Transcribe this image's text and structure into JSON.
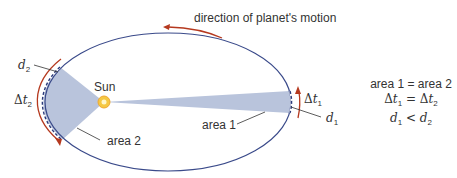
{
  "title": "direction of planet's motion",
  "labels": {
    "sun": "Sun",
    "area1": "area 1",
    "area2": "area 2",
    "d1": {
      "var": "d",
      "sub": "1"
    },
    "d2": {
      "var": "d",
      "sub": "2"
    },
    "dt1": {
      "delta": "Δ",
      "var": "t",
      "sub": "1"
    },
    "dt2": {
      "delta": "Δ",
      "var": "t",
      "sub": "2"
    }
  },
  "equations": {
    "line1": "area 1 = area 2",
    "line2": {
      "lhs_delta": "Δ",
      "lhs_var": "t",
      "lhs_sub": "1",
      "op": "=",
      "rhs_delta": "Δ",
      "rhs_var": "t",
      "rhs_sub": "2"
    },
    "line3": {
      "lhs_var": "d",
      "lhs_sub": "1",
      "op": "<",
      "rhs_var": "d",
      "rhs_sub": "2"
    }
  },
  "colors": {
    "orbit": "#3a4a8a",
    "sweep_fill": "#b9c4dc",
    "arrow": "#b5391f",
    "sun_fill": "#f5c842",
    "text": "#333333"
  }
}
